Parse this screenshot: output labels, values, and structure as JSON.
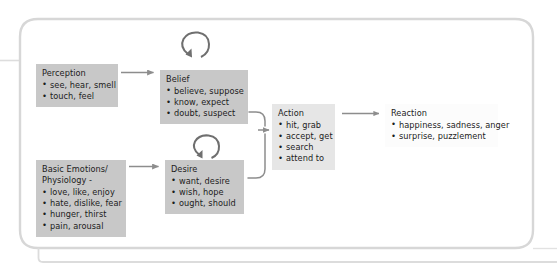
{
  "diagram": {
    "frame": {
      "name": "rounded-panel-border",
      "stroke_color": "#d5d5d5"
    },
    "colors": {
      "box_fill_dark": "#c8c8c8",
      "box_fill_mid": "#e6e6e6",
      "box_fill_light": "#fcfcfc",
      "connector": "#8d8d8d",
      "text": "#1c1c1c"
    },
    "icons": {
      "loop_top": "circular-arrow-loop-icon",
      "loop_mid": "circular-arrow-loop-icon"
    },
    "nodes": {
      "perception": {
        "title": "Perception",
        "items": [
          "see, hear, smell",
          "touch, feel"
        ]
      },
      "belief": {
        "title": "Belief",
        "items": [
          "believe, suppose",
          "know, expect",
          "doubt, suspect"
        ]
      },
      "basic_emotions": {
        "title": "Basic Emotions/\nPhysiology -",
        "items": [
          "love, like, enjoy",
          "hate, dislike, fear",
          "hunger, thirst",
          "pain, arousal"
        ]
      },
      "desire": {
        "title": "Desire",
        "items": [
          "want, desire",
          "wish, hope",
          "ought, should"
        ]
      },
      "action": {
        "title": "Action",
        "items": [
          "hit, grab",
          "accept, get",
          "search",
          "attend to"
        ]
      },
      "reaction": {
        "title": "Reaction",
        "items": [
          "happiness, sadness, anger",
          "surprise, puzzlement"
        ]
      }
    },
    "connectors": [
      {
        "name": "arrow-perception-to-belief",
        "from": "perception",
        "to": "belief",
        "style": "straight"
      },
      {
        "name": "arrow-basic-emotions-to-desire",
        "from": "basic_emotions",
        "to": "desire",
        "style": "straight"
      },
      {
        "name": "arrow-belief-to-action",
        "from": "belief",
        "to": "action",
        "style": "curved-merge"
      },
      {
        "name": "arrow-desire-to-action",
        "from": "desire",
        "to": "action",
        "style": "curved-merge"
      },
      {
        "name": "arrow-action-to-reaction",
        "from": "action",
        "to": "reaction",
        "style": "straight"
      }
    ]
  }
}
